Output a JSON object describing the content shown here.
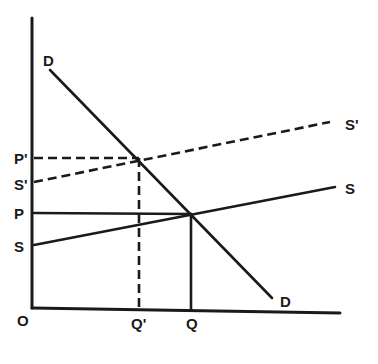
{
  "diagram": {
    "type": "supply-demand",
    "colors": {
      "ink": "#1a1a1a",
      "background": "#ffffff"
    },
    "axes": {
      "origin_label": "O",
      "y_axis": {
        "x": 32,
        "y_top": 18,
        "y_bottom": 308
      },
      "x_axis": {
        "y_left": 308,
        "x_left": 32,
        "x_right": 340,
        "y_right": 313
      }
    },
    "curves": [
      {
        "id": "demand",
        "label": "D",
        "end_label": "D",
        "style": "solid",
        "from": [
          50,
          70
        ],
        "to": [
          272,
          298
        ]
      },
      {
        "id": "supply",
        "label": "S",
        "axis_label": "S",
        "style": "solid",
        "from": [
          34,
          245
        ],
        "to": [
          335,
          187
        ]
      },
      {
        "id": "supply-shifted",
        "label": "S'",
        "axis_label": "S'",
        "style": "dashed",
        "from": [
          34,
          182
        ],
        "to": [
          330,
          122
        ]
      }
    ],
    "guides": [
      {
        "id": "price-p-prime",
        "label": "P'",
        "style": "dashed",
        "from": [
          34,
          158
        ],
        "to": [
          139,
          158
        ]
      },
      {
        "id": "quantity-q-prime",
        "label": "Q'",
        "style": "dashed",
        "from": [
          139,
          158
        ],
        "to": [
          139,
          308
        ]
      },
      {
        "id": "price-p",
        "label": "P",
        "style": "solid",
        "from": [
          34,
          213
        ],
        "to": [
          191,
          214
        ]
      },
      {
        "id": "quantity-q",
        "label": "Q",
        "style": "solid",
        "from": [
          191,
          214
        ],
        "to": [
          191,
          310
        ]
      }
    ],
    "labels": {
      "origin": "O",
      "demand_top": "D",
      "demand_bottom": "D",
      "price_new": "P'",
      "price_old": "P",
      "supply_new_axis": "S'",
      "supply_old_axis": "S",
      "supply_new_end": "S'",
      "supply_old_end": "S",
      "quantity_new": "Q'",
      "quantity_old": "Q"
    },
    "equilibria": [
      {
        "id": "original",
        "price": "P",
        "quantity": "Q",
        "point": [
          191,
          214
        ]
      },
      {
        "id": "shifted",
        "price": "P'",
        "quantity": "Q'",
        "point": [
          139,
          158
        ]
      }
    ]
  }
}
